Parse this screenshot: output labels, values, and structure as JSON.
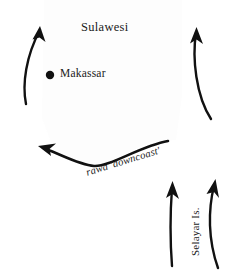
{
  "figure": {
    "name": "Sulawesi voyaging map",
    "background_color": "#ffffff",
    "ink_color": "#111111",
    "width": 236,
    "height": 279
  },
  "labels": {
    "region": "Sulawesi",
    "city": "Makassar",
    "route": "rawa 'downcoast'",
    "island": "Selayar Is."
  },
  "markers": [
    {
      "name": "makassar-dot",
      "label": "Makassar",
      "shape": "filled-circle",
      "x": 50,
      "y": 75,
      "radius": 4.2,
      "color": "#111111"
    }
  ],
  "arrows": [
    {
      "name": "arrow-northwest-coast",
      "direction": "north-northeast",
      "description": "curved arrow along west coast pointing up and to the right",
      "path": "M 26 104 C 22 84 26 56 40 30",
      "head_at": [
        40,
        30
      ],
      "head_angle": -58
    },
    {
      "name": "arrow-northeast-coast",
      "direction": "north",
      "description": "curved arrow along east coast pointing up",
      "path": "M 211 119 C 196 96 192 58 196 33",
      "head_at": [
        196,
        33
      ],
      "head_angle": -82
    },
    {
      "name": "arrow-downcoast",
      "direction": "west-northwest",
      "description": "long curved arrow sweeping left along the south coast, labelled rawa downcoast",
      "path": "M 168 141 C 140 146 110 167 94 166 C 80 165 64 156 46 149",
      "head_at": [
        46,
        149
      ],
      "head_angle": 199
    },
    {
      "name": "arrow-selayar-inner",
      "direction": "north",
      "description": "straight arrow west of Selayar Is. pointing north",
      "path": "M 172 266 C 170 240 170 215 172 188",
      "head_at": [
        172,
        188
      ],
      "head_angle": -87
    },
    {
      "name": "arrow-selayar-outer",
      "direction": "north",
      "description": "curved arrow east of Selayar Is. pointing north",
      "path": "M 218 268 C 208 240 208 210 214 186",
      "head_at": [
        214,
        186
      ],
      "head_angle": -79
    }
  ]
}
